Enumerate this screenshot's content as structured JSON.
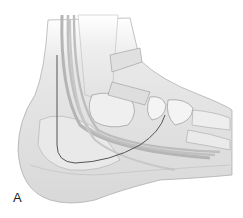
{
  "figure": {
    "panel_label": "A",
    "colors": {
      "background": "#ffffff",
      "skin": "#e6e6e6",
      "skin_shadow": "#cfcfcf",
      "bone": "#f2f2f2",
      "tendon": "#bdbdbd",
      "outline": "#8a8a8a",
      "dark_line": "#555555"
    }
  }
}
